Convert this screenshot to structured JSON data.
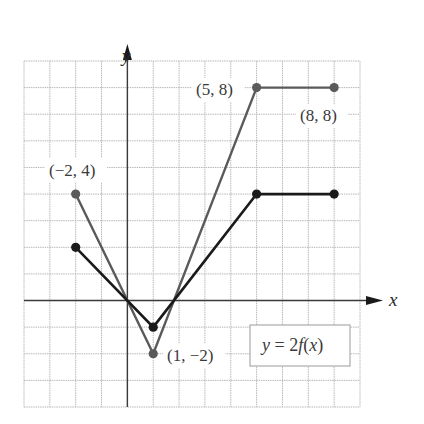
{
  "chart_data": {
    "type": "line",
    "title": "",
    "xlabel": "x",
    "ylabel": "y",
    "xlim": [
      -4,
      9
    ],
    "ylim": [
      -4,
      9
    ],
    "grid": true,
    "legend": {
      "text": "y = 2f(x)",
      "position": "lower right"
    },
    "series": [
      {
        "name": "y = 2f(x)",
        "color": "#5a5a5a",
        "points": [
          [
            -2,
            4
          ],
          [
            1,
            -2
          ],
          [
            5,
            8
          ],
          [
            8,
            8
          ]
        ]
      },
      {
        "name": "y = f(x)",
        "color": "#1a1a1a",
        "points": [
          [
            -2,
            2
          ],
          [
            1,
            -1
          ],
          [
            5,
            4
          ],
          [
            8,
            4
          ]
        ]
      }
    ],
    "annotations": [
      {
        "text": "(−2, 4)",
        "x": -2,
        "y": 4
      },
      {
        "text": "(1, −2)",
        "x": 1,
        "y": -2
      },
      {
        "text": "(5, 8)",
        "x": 5,
        "y": 8
      },
      {
        "text": "(8, 8)",
        "x": 8,
        "y": 8
      }
    ]
  },
  "labels": {
    "x_axis": "x",
    "y_axis": "y",
    "pt_m2_4": "(−2, 4)",
    "pt_1_m2": "(1, −2)",
    "pt_5_8": "(5, 8)",
    "pt_8_8": "(8, 8)",
    "equation_prefix": "y",
    "equation_mid": " = 2",
    "equation_f": "f",
    "equation_open": "(",
    "equation_x": "x",
    "equation_close": ")"
  },
  "colors": {
    "grid": "#b8b8b8",
    "axis": "#3a3a3a",
    "series_2f": "#5a5a5a",
    "series_f": "#1a1a1a"
  }
}
